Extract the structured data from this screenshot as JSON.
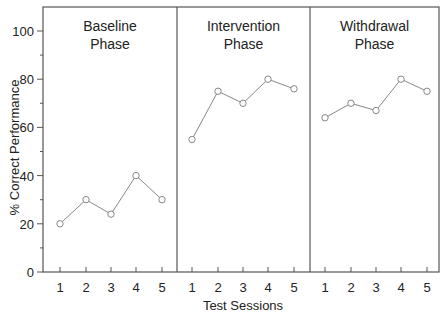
{
  "chart_data": {
    "type": "line",
    "title": "",
    "xlabel": "Test Sessions",
    "ylabel": "% Correct Performance",
    "ylim": [
      0,
      110
    ],
    "yticks": [
      0,
      20,
      40,
      60,
      80,
      100
    ],
    "grid": false,
    "legend": null,
    "phases": [
      {
        "name": "Baseline Phase",
        "label_lines": [
          "Baseline",
          "Phase"
        ],
        "x": [
          1,
          2,
          3,
          4,
          5
        ],
        "values": [
          20,
          30,
          24,
          40,
          30
        ]
      },
      {
        "name": "Intervention Phase",
        "label_lines": [
          "Intervention",
          "Phase"
        ],
        "x": [
          1,
          2,
          3,
          4,
          5
        ],
        "values": [
          55,
          75,
          70,
          80,
          76
        ]
      },
      {
        "name": "Withdrawal Phase",
        "label_lines": [
          "Withdrawal",
          "Phase"
        ],
        "x": [
          1,
          2,
          3,
          4,
          5
        ],
        "values": [
          64,
          70,
          67,
          80,
          75
        ]
      }
    ],
    "colors": {
      "line": "#888888",
      "marker": "#888888",
      "axis": "#555555"
    }
  }
}
